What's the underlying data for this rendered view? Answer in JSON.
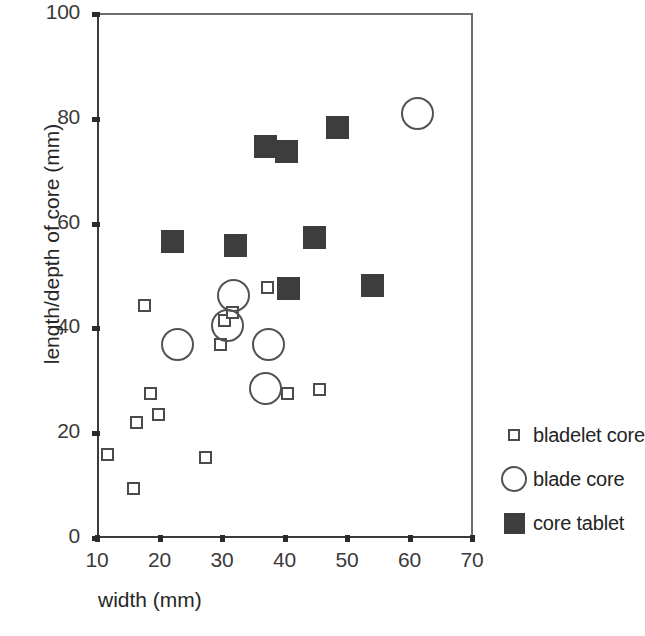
{
  "chart_data": {
    "type": "scatter",
    "title": "",
    "xlabel": "width (mm)",
    "ylabel": "length/depth of core (mm)",
    "xlim": [
      10,
      70
    ],
    "ylim": [
      0,
      100
    ],
    "xticks": [
      10,
      20,
      30,
      40,
      50,
      60,
      70
    ],
    "yticks": [
      0,
      20,
      40,
      60,
      80,
      100
    ],
    "grid": false,
    "legend_position": "right",
    "series": [
      {
        "name": "bladelet core",
        "marker": "open-square-small",
        "color": "#4b4b4b",
        "points": [
          {
            "x": 11.6,
            "y": 16.0
          },
          {
            "x": 15.8,
            "y": 9.5
          },
          {
            "x": 16.3,
            "y": 22.0
          },
          {
            "x": 17.6,
            "y": 44.3
          },
          {
            "x": 18.5,
            "y": 27.5
          },
          {
            "x": 19.8,
            "y": 23.5
          },
          {
            "x": 27.3,
            "y": 15.3
          },
          {
            "x": 29.7,
            "y": 37.0
          },
          {
            "x": 30.4,
            "y": 41.5
          },
          {
            "x": 31.6,
            "y": 43.0
          },
          {
            "x": 37.3,
            "y": 47.8
          },
          {
            "x": 40.4,
            "y": 27.5
          },
          {
            "x": 45.6,
            "y": 28.3
          }
        ]
      },
      {
        "name": "blade core",
        "marker": "open-circle-large",
        "color": "#525252",
        "points": [
          {
            "x": 22.8,
            "y": 37.0
          },
          {
            "x": 30.8,
            "y": 40.5
          },
          {
            "x": 31.8,
            "y": 46.3
          },
          {
            "x": 36.9,
            "y": 28.5
          },
          {
            "x": 37.4,
            "y": 37.0
          },
          {
            "x": 61.3,
            "y": 81.0
          }
        ]
      },
      {
        "name": "core tablet",
        "marker": "filled-square",
        "color": "#3d3d3d",
        "points": [
          {
            "x": 22.0,
            "y": 56.5
          },
          {
            "x": 32.2,
            "y": 55.8
          },
          {
            "x": 37.0,
            "y": 74.8
          },
          {
            "x": 40.3,
            "y": 73.8
          },
          {
            "x": 40.6,
            "y": 47.7
          },
          {
            "x": 44.8,
            "y": 57.3
          },
          {
            "x": 48.5,
            "y": 78.3
          },
          {
            "x": 54.0,
            "y": 48.2
          }
        ]
      }
    ]
  },
  "axes": {
    "y_tick_labels": [
      "100",
      "80",
      "60",
      "40",
      "20",
      "0"
    ],
    "x_tick_labels": [
      "10",
      "20",
      "30",
      "40",
      "50",
      "60",
      "70"
    ],
    "y_title": "length/depth of core (mm)",
    "x_title": "width (mm)"
  },
  "legend": {
    "items": [
      {
        "label": "bladelet core",
        "key": "open-square-small-icon"
      },
      {
        "label": "blade core",
        "key": "open-circle-icon"
      },
      {
        "label": "core tablet",
        "key": "filled-square-icon"
      }
    ]
  }
}
